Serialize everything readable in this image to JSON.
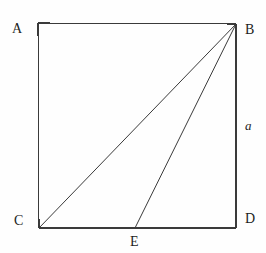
{
  "figure": {
    "kind": "geometry-diagram",
    "background_color": "#fefefe",
    "stroke_color": "#3a3a3a",
    "stroke_width": 1,
    "labels": {
      "a": "A",
      "b": "B",
      "c": "C",
      "d": "D",
      "e": "E",
      "side_a": "a"
    },
    "points": [
      {
        "name": "A",
        "label": "A",
        "x": 38,
        "y": 23
      },
      {
        "name": "B",
        "label": "B",
        "x": 236,
        "y": 24
      },
      {
        "name": "C",
        "label": "C",
        "x": 39,
        "y": 228
      },
      {
        "name": "D",
        "label": "D",
        "x": 236,
        "y": 228
      },
      {
        "name": "E",
        "label": "E",
        "x": 135,
        "y": 228
      }
    ],
    "square": {
      "top_left": {
        "x": 38,
        "y": 23
      },
      "top_right": {
        "x": 236,
        "y": 24
      },
      "bottom_right": {
        "x": 236,
        "y": 228
      },
      "bottom_left": {
        "x": 39,
        "y": 228
      },
      "side_length_label": "a"
    },
    "segments": [
      {
        "name": "side-AB",
        "from": "A",
        "to": "B",
        "x1": 38,
        "y1": 23,
        "x2": 236,
        "y2": 24
      },
      {
        "name": "side-BD",
        "from": "B",
        "to": "D",
        "x1": 236,
        "y1": 24,
        "x2": 236,
        "y2": 228
      },
      {
        "name": "side-DC",
        "from": "D",
        "to": "C",
        "x1": 236,
        "y1": 228,
        "x2": 39,
        "y2": 228
      },
      {
        "name": "side-CA",
        "from": "C",
        "to": "A",
        "x1": 39,
        "y1": 228,
        "x2": 38,
        "y2": 23
      },
      {
        "name": "diagonal-BC",
        "from": "B",
        "to": "C",
        "x1": 236,
        "y1": 24,
        "x2": 39,
        "y2": 228
      },
      {
        "name": "segment-BE",
        "from": "B",
        "to": "E",
        "x1": 236,
        "y1": 24,
        "x2": 135,
        "y2": 228
      }
    ]
  }
}
